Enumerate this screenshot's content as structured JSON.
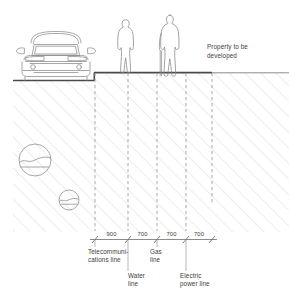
{
  "drawing": {
    "type": "site-section",
    "title_annotation": "Property to be developed",
    "ground_label": "existing grade",
    "colors": {
      "line": "#6e6e6e",
      "hatch": "#d8d8d8",
      "ground": "#555555",
      "text": "#3d3d3d",
      "dash": "#9a9a9a",
      "background": "#ffffff"
    }
  },
  "annotations": [
    {
      "id": "property-note",
      "text": "Property to be\ndeveloped",
      "x": 207,
      "y": 44
    }
  ],
  "scene": {
    "vehicle": {
      "name": "car-front-elevation",
      "x": 14,
      "y": 22,
      "width": 86,
      "height": 58
    },
    "figures": [
      {
        "name": "person-standing",
        "x": 116,
        "y": 18,
        "height": 58,
        "has_cane": false
      },
      {
        "name": "person-with-cane",
        "x": 155,
        "y": 14,
        "height": 62,
        "has_cane": true
      }
    ],
    "inclusions": [
      {
        "name": "rock-symbol-large",
        "cx": 35,
        "cy": 160,
        "r": 16
      },
      {
        "name": "rock-symbol-small",
        "cx": 69,
        "cy": 200,
        "r": 10
      }
    ],
    "grade": {
      "road_level_y": 81,
      "property_level_y": 73,
      "curb_x": 94,
      "hatch_left": 13,
      "hatch_right": 289,
      "hatch_bottom": 232
    }
  },
  "utilities": [
    {
      "id": "telecom",
      "x": 95,
      "label": "Telecommuni-\ncations line",
      "label_x": 88,
      "label_y": 250,
      "row": "top"
    },
    {
      "id": "water",
      "x": 128,
      "label": "Water\nline",
      "label_x": 128,
      "label_y": 274,
      "row": "bottom"
    },
    {
      "id": "gas",
      "x": 157,
      "label": "Gas\nline",
      "label_x": 157,
      "label_y": 250,
      "row": "top"
    },
    {
      "id": "electric",
      "x": 186,
      "label": "Electric\npower line",
      "label_x": 186,
      "label_y": 274,
      "row": "bottom"
    },
    {
      "id": "boundary",
      "x": 212,
      "label": "",
      "label_x": 212,
      "label_y": 250,
      "row": "none"
    }
  ],
  "dimension_chain": {
    "y": 236,
    "unit": "mm",
    "ticks": [
      95,
      128,
      157,
      186,
      212
    ],
    "segments": [
      {
        "from": 95,
        "to": 128,
        "value": "900",
        "center": 111.5
      },
      {
        "from": 128,
        "to": 157,
        "value": "700",
        "center": 142.5
      },
      {
        "from": 157,
        "to": 186,
        "value": "700",
        "center": 171.5
      },
      {
        "from": 186,
        "to": 212,
        "value": "700",
        "center": 199
      }
    ]
  }
}
